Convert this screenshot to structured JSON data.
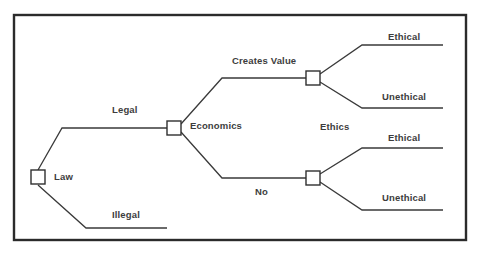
{
  "diagram": {
    "type": "decision-tree",
    "border_color": "#2b2b2b",
    "line_color": "#3a3a3a",
    "node_fill": "#ffffff",
    "text_color": "#3d3d3d",
    "nodes": [
      {
        "id": "law",
        "label": "Law",
        "x": 31,
        "y": 170,
        "size": 14
      },
      {
        "id": "economics",
        "label": "Economics",
        "x": 167,
        "y": 121,
        "size": 14
      },
      {
        "id": "ethics_upper",
        "label": "Ethics",
        "x": 306,
        "y": 71,
        "size": 14
      },
      {
        "id": "ethics_lower",
        "label": "",
        "x": 306,
        "y": 171,
        "size": 14
      }
    ],
    "labels": {
      "law": "Law",
      "legal": "Legal",
      "illegal": "Illegal",
      "economics": "Economics",
      "creates_value": "Creates Value",
      "no": "No",
      "ethics": "Ethics",
      "ethical_upper": "Ethical",
      "unethical_upper": "Unethical",
      "ethical_lower": "Ethical",
      "unethical_lower": "Unethical"
    },
    "branches": [
      {
        "id": "law-to-legal",
        "from": "law",
        "to": "economics",
        "label": "Legal"
      },
      {
        "id": "law-to-illegal",
        "from": "law",
        "to": "illegal-terminal",
        "label": "Illegal"
      },
      {
        "id": "economics-to-creates-value",
        "from": "economics",
        "to": "ethics_upper",
        "label": "Creates Value"
      },
      {
        "id": "economics-to-no",
        "from": "economics",
        "to": "ethics_lower",
        "label": "No"
      },
      {
        "id": "ethics-upper-to-ethical",
        "from": "ethics_upper",
        "to": "ethical-upper-terminal",
        "label": "Ethical"
      },
      {
        "id": "ethics-upper-to-unethical",
        "from": "ethics_upper",
        "to": "unethical-upper-terminal",
        "label": "Unethical"
      },
      {
        "id": "ethics-lower-to-ethical",
        "from": "ethics_lower",
        "to": "ethical-lower-terminal",
        "label": "Ethical"
      },
      {
        "id": "ethics-lower-to-unethical",
        "from": "ethics_lower",
        "to": "unethical-lower-terminal",
        "label": "Unethical"
      }
    ]
  }
}
